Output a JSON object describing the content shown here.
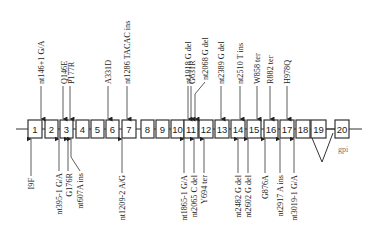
{
  "diagram": {
    "title": "",
    "backbone": {
      "y": 129,
      "x_start": 16,
      "x_end": 362
    },
    "exons": [
      {
        "label": "1",
        "x": 28,
        "w": 14
      },
      {
        "label": "2",
        "x": 45,
        "w": 13
      },
      {
        "label": "3",
        "x": 60,
        "w": 13
      },
      {
        "label": "4",
        "x": 76,
        "w": 13
      },
      {
        "label": "5",
        "x": 91,
        "w": 13
      },
      {
        "label": "6",
        "x": 106,
        "w": 13
      },
      {
        "label": "7",
        "x": 122,
        "w": 14
      },
      {
        "label": "8",
        "x": 141,
        "w": 13
      },
      {
        "label": "9",
        "x": 156,
        "w": 13
      },
      {
        "label": "10",
        "x": 171,
        "w": 13
      },
      {
        "label": "11",
        "x": 184,
        "w": 14
      },
      {
        "label": "12",
        "x": 199,
        "w": 14
      },
      {
        "label": "13",
        "x": 215,
        "w": 14
      },
      {
        "label": "14",
        "x": 231,
        "w": 14
      },
      {
        "label": "15",
        "x": 247,
        "w": 14
      },
      {
        "label": "16",
        "x": 264,
        "w": 14
      },
      {
        "label": "17",
        "x": 280,
        "w": 14
      },
      {
        "label": "18",
        "x": 296,
        "w": 14
      },
      {
        "label": "19",
        "x": 311,
        "w": 15
      },
      {
        "label": "20",
        "x": 335,
        "w": 14
      }
    ],
    "splice_loop": {
      "from_x": 318,
      "to_x": 336,
      "apex_x": 322,
      "apex_y": 162
    },
    "gpi_label": "gpi",
    "top_mutations": [
      {
        "label": "nt146+1 G/A",
        "x": 41,
        "text_x": 41,
        "text_bottom": 84
      },
      {
        "label": "Q146E",
        "x": 63,
        "text_x": 64,
        "text_bottom": 84
      },
      {
        "label": "P177R",
        "x": 70,
        "text_x": 71,
        "text_bottom": 84
      },
      {
        "label": "A331D",
        "x": 108,
        "text_x": 108,
        "text_bottom": 84
      },
      {
        "label": "nt1286 TACAC ins",
        "x": 127,
        "text_x": 127,
        "text_bottom": 84
      },
      {
        "label": "nt1918 G del",
        "x": 188,
        "text_x": 188,
        "text_bottom": 84
      },
      {
        "label": "G631R",
        "x": 191,
        "text_x": 192,
        "text_bottom": 84
      },
      {
        "label": "nt2068 G del",
        "x": 195,
        "text_x": 205,
        "text_bottom": 80,
        "bent": true
      },
      {
        "label": "nt2389 G del",
        "x": 221,
        "text_x": 221,
        "text_bottom": 84
      },
      {
        "label": "nt2510 T ins",
        "x": 240,
        "text_x": 240,
        "text_bottom": 84
      },
      {
        "label": "W858 ter",
        "x": 257,
        "text_x": 257,
        "text_bottom": 84
      },
      {
        "label": "R882 ter",
        "x": 270,
        "text_x": 270,
        "text_bottom": 84
      },
      {
        "label": "H978Q",
        "x": 287,
        "text_x": 287,
        "text_bottom": 84
      }
    ],
    "bottom_mutations": [
      {
        "label": "I9F",
        "x": 31,
        "text_x": 31,
        "text_top": 178
      },
      {
        "label": "nt395-1 G/A",
        "x": 59,
        "text_x": 59,
        "text_top": 173
      },
      {
        "label": "G176R",
        "x": 68,
        "text_x": 69,
        "text_top": 173
      },
      {
        "label": "nt607A ins",
        "x": 71,
        "text_x": 80,
        "text_top": 173,
        "bent": true
      },
      {
        "label": "nt1209-2 A/G",
        "x": 122,
        "text_x": 122,
        "text_top": 175
      },
      {
        "label": "nt1865-1 G/A",
        "x": 184,
        "text_x": 184,
        "text_top": 175
      },
      {
        "label": "nt2065 C del",
        "x": 194,
        "text_x": 194,
        "text_top": 175
      },
      {
        "label": "Y694 ter",
        "x": 204,
        "text_x": 204,
        "text_top": 175
      },
      {
        "label": "nt2482 G del",
        "x": 238,
        "text_x": 238,
        "text_top": 175
      },
      {
        "label": "nt2602 G del",
        "x": 248,
        "text_x": 248,
        "text_top": 175
      },
      {
        "label": "G876A",
        "x": 265,
        "text_x": 265,
        "text_top": 175
      },
      {
        "label": "nt2917 A ins",
        "x": 280,
        "text_x": 280,
        "text_top": 175
      },
      {
        "label": "nt3019-1 G/A",
        "x": 294,
        "text_x": 294,
        "text_top": 175
      }
    ],
    "colors": {
      "stroke": "#333333",
      "fill": "#ffffff",
      "text": "#222222",
      "gpi": "#777777"
    }
  }
}
